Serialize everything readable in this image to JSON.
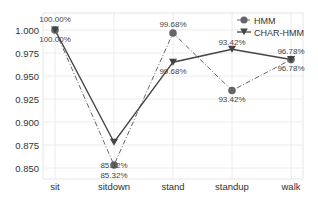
{
  "chart_data": {
    "type": "line",
    "title": "",
    "xlabel": "",
    "ylabel": "",
    "categories": [
      "sit",
      "sitdown",
      "stand",
      "standup",
      "walk"
    ],
    "ylim": [
      0.84,
      1.018
    ],
    "yticks": [
      0.85,
      0.875,
      0.9,
      0.925,
      0.95,
      0.975,
      1.0
    ],
    "ytick_labels": [
      "0.850",
      "0.875",
      "0.900",
      "0.925",
      "0.950",
      "0.975",
      "1.000"
    ],
    "grid": true,
    "legend_position": "upper right",
    "series": [
      {
        "name": "HMM",
        "marker": "circle",
        "linestyle": "dash-dot",
        "color": "#666666",
        "values": [
          1.0,
          0.8532,
          0.9968,
          0.9342,
          0.9678
        ],
        "labels": [
          "100.00%",
          "85.32%",
          "99.68%",
          "93.42%",
          "96.78%"
        ]
      },
      {
        "name": "CHAR-HMM",
        "marker": "triangle-down",
        "linestyle": "solid",
        "color": "#444444",
        "values": [
          1.0,
          0.878,
          0.965,
          0.979,
          0.968
        ],
        "labels": [
          "100.00%",
          "85.32%",
          "99.68%",
          "93.42%",
          "96.78%"
        ]
      }
    ]
  },
  "legend": {
    "items": [
      "HMM",
      "CHAR-HMM"
    ]
  }
}
